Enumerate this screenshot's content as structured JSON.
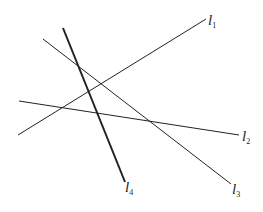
{
  "diagram": {
    "type": "four intersecting lines",
    "lines": [
      {
        "id": "l1",
        "name": "l",
        "subscript": "1",
        "x1": 18,
        "y1": 135,
        "x2": 206,
        "y2": 19,
        "width": 1,
        "label_x": 208,
        "label_y": 13
      },
      {
        "id": "l2",
        "name": "l",
        "subscript": "2",
        "x1": 19,
        "y1": 101,
        "x2": 239,
        "y2": 135,
        "width": 1,
        "label_x": 242,
        "label_y": 129
      },
      {
        "id": "l3",
        "name": "l",
        "subscript": "3",
        "x1": 43,
        "y1": 39,
        "x2": 231,
        "y2": 184,
        "width": 1,
        "label_x": 232,
        "label_y": 182
      },
      {
        "id": "l4",
        "name": "l",
        "subscript": "4",
        "x1": 63,
        "y1": 28,
        "x2": 125,
        "y2": 182,
        "width": 2,
        "label_x": 125,
        "label_y": 180
      }
    ],
    "stroke_color": "#222222"
  }
}
